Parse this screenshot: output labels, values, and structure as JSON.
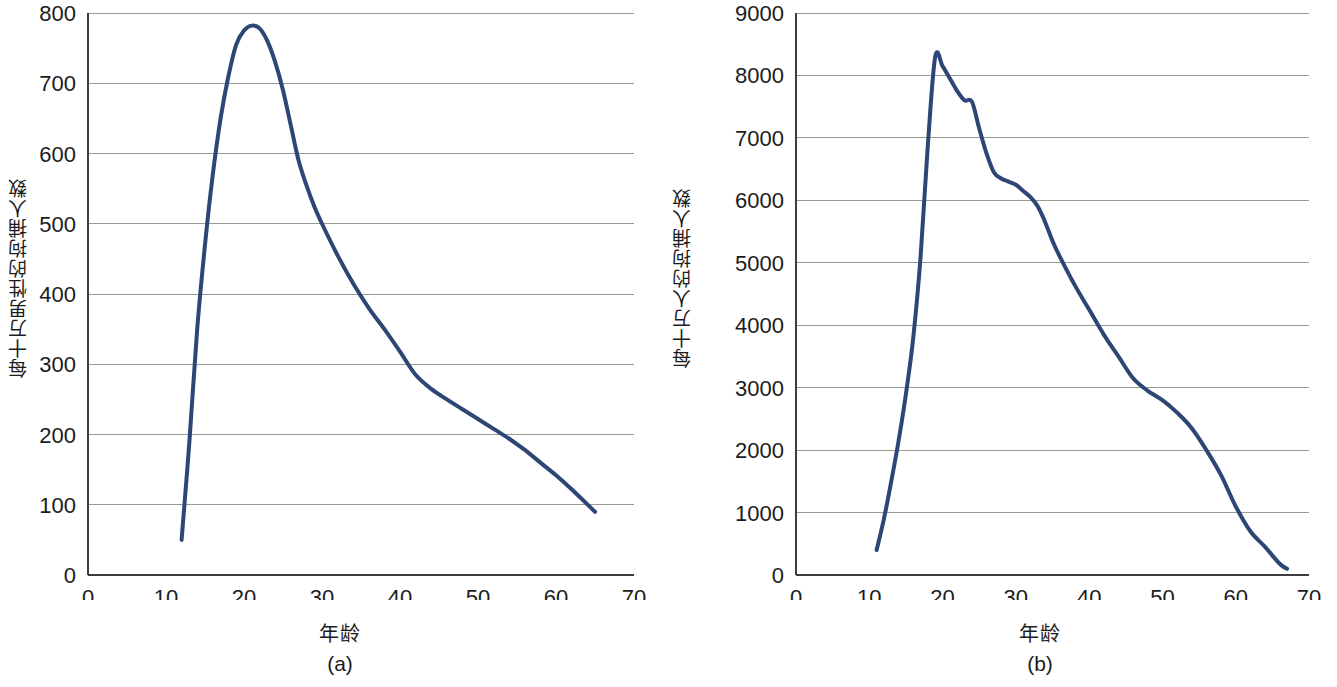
{
  "figure": {
    "panels": [
      {
        "id": "a",
        "caption": "(a)",
        "xlabel": "年龄",
        "ylabel": "每十万男性的拘捕人数",
        "line_color": "#2d4675"
      },
      {
        "id": "b",
        "caption": "(b)",
        "xlabel": "年龄",
        "ylabel": "每十万人的拘捕人数",
        "line_color": "#2d4675"
      }
    ]
  },
  "chart_data": [
    {
      "type": "line",
      "title": "",
      "subtitle": "",
      "panel": "(a)",
      "xlabel": "年龄",
      "ylabel": "每十万男性的拘捕人数",
      "xlim": [
        0,
        70
      ],
      "ylim": [
        0,
        800
      ],
      "xticks": [
        0,
        10,
        20,
        30,
        40,
        50,
        60,
        70
      ],
      "yticks": [
        0,
        100,
        200,
        300,
        400,
        500,
        600,
        700,
        800
      ],
      "grid": "horizontal",
      "legend": "none",
      "series": [
        {
          "name": "每十万男性的拘捕人数",
          "color": "#2d4675",
          "x": [
            12,
            13,
            14,
            15,
            16,
            17,
            18,
            19,
            20,
            21,
            22,
            23,
            24,
            25,
            26,
            27,
            28,
            29,
            30,
            32,
            34,
            36,
            38,
            40,
            42,
            44,
            46,
            48,
            50,
            52,
            54,
            56,
            58,
            60,
            62,
            65
          ],
          "values": [
            50,
            190,
            350,
            470,
            570,
            650,
            710,
            755,
            775,
            782,
            778,
            760,
            730,
            690,
            640,
            590,
            555,
            525,
            500,
            455,
            415,
            380,
            350,
            318,
            285,
            265,
            250,
            236,
            222,
            208,
            194,
            178,
            160,
            142,
            122,
            90
          ]
        }
      ]
    },
    {
      "type": "line",
      "title": "",
      "subtitle": "",
      "panel": "(b)",
      "xlabel": "年龄",
      "ylabel": "每十万人的拘捕人数",
      "xlim": [
        0,
        70
      ],
      "ylim": [
        0,
        9000
      ],
      "xticks": [
        0,
        10,
        20,
        30,
        40,
        50,
        60,
        70
      ],
      "yticks": [
        0,
        1000,
        2000,
        3000,
        4000,
        5000,
        6000,
        7000,
        8000,
        9000
      ],
      "grid": "horizontal",
      "legend": "none",
      "series": [
        {
          "name": "每十万人的拘捕人数",
          "color": "#2d4675",
          "x": [
            11,
            12,
            13,
            14,
            15,
            16,
            17,
            18,
            19,
            20,
            21,
            22,
            23,
            24,
            25,
            26,
            27,
            28,
            29,
            30,
            31,
            32,
            33,
            34,
            35,
            36,
            38,
            40,
            42,
            44,
            46,
            48,
            50,
            52,
            54,
            56,
            58,
            60,
            62,
            64,
            66,
            67
          ],
          "values": [
            400,
            900,
            1500,
            2150,
            2900,
            3800,
            5100,
            6900,
            8300,
            8150,
            7950,
            7750,
            7600,
            7580,
            7150,
            6750,
            6450,
            6350,
            6300,
            6250,
            6150,
            6050,
            5900,
            5650,
            5350,
            5100,
            4650,
            4250,
            3850,
            3500,
            3150,
            2950,
            2800,
            2600,
            2350,
            2000,
            1600,
            1100,
            700,
            450,
            180,
            100
          ]
        }
      ]
    }
  ]
}
